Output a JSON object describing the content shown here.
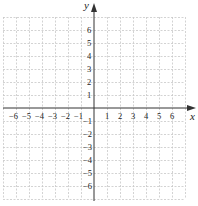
{
  "chart_data": {
    "type": "coordinate-grid",
    "title": "",
    "xlabel": "x",
    "ylabel": "y",
    "xlim": [
      -7,
      7
    ],
    "ylim": [
      -7,
      7
    ],
    "grid": true,
    "grid_style": "dashed",
    "x_ticks": [
      -6,
      -5,
      -4,
      -3,
      -2,
      -1,
      1,
      2,
      3,
      4,
      5,
      6
    ],
    "y_ticks": [
      6,
      5,
      4,
      3,
      2,
      1,
      -1,
      -2,
      -3,
      -4,
      -5,
      -6
    ],
    "x_tick_labels": [
      "−6",
      "−5",
      "−4",
      "−3",
      "−2",
      "−1",
      "1",
      "2",
      "3",
      "4",
      "5",
      "6"
    ],
    "y_tick_labels": [
      "6",
      "5",
      "4",
      "3",
      "2",
      "1",
      "−1",
      "−2",
      "−3",
      "−4",
      "−5",
      "−6"
    ],
    "series": []
  },
  "axes": {
    "x_name": "x",
    "y_name": "y"
  },
  "colors": {
    "grid": "#c8c8c8",
    "axis": "#333333",
    "text": "#222222"
  }
}
